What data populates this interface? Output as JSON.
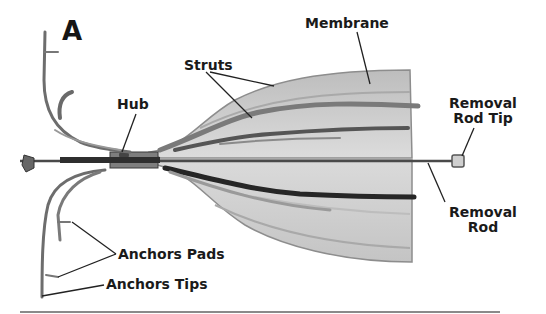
{
  "figure": {
    "panel_letter": "A",
    "colors": {
      "background": "#ffffff",
      "label_text": "#1a1a1a",
      "membrane_fill": "#d4d4d4",
      "strut_dark": "#3a3a3a",
      "leader_line": "#222222",
      "bottom_rule": "#8a8a8a"
    }
  },
  "labels": {
    "membrane": "Membrane",
    "struts": "Struts",
    "hub": "Hub",
    "removal_rod_tip_line1": "Removal",
    "removal_rod_tip_line2": "Rod Tip",
    "removal_rod_line1": "Removal",
    "removal_rod_line2": "Rod",
    "anchors_pads": "Anchors Pads",
    "anchors_tips": "Anchors Tips"
  }
}
